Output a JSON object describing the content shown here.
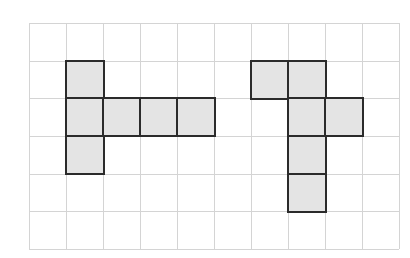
{
  "grid": {
    "columns": 10,
    "rows": 6,
    "line_color": "#d4d4d4",
    "cell_fill": "#e4e4e4",
    "outline_color": "#2b2b2b"
  },
  "shapes": [
    {
      "name": "left-net",
      "cells": [
        [
          1,
          1
        ],
        [
          1,
          2
        ],
        [
          2,
          2
        ],
        [
          3,
          2
        ],
        [
          4,
          2
        ],
        [
          1,
          3
        ]
      ]
    },
    {
      "name": "right-net",
      "cells": [
        [
          6,
          1
        ],
        [
          7,
          1
        ],
        [
          7,
          2
        ],
        [
          8,
          2
        ],
        [
          7,
          3
        ],
        [
          7,
          4
        ]
      ]
    }
  ]
}
